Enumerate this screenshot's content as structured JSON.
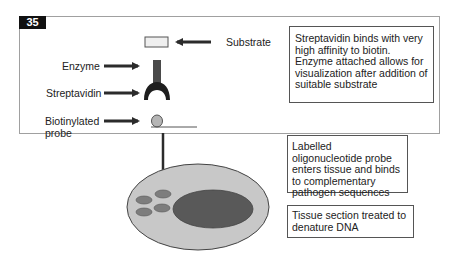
{
  "figure": {
    "number": "35",
    "labels": {
      "substrate": "Substrate",
      "enzyme": "Enzyme",
      "streptavidin": "Streptavidin",
      "biotinylated_probe": "Biotinylated probe"
    },
    "boxes": [
      {
        "id": "streptavidin-box",
        "text": "Streptavidin binds with very high affinity to biotin. Enzyme attached allows for visualization after addition of suitable substrate"
      },
      {
        "id": "probe-box",
        "text": "Labelled oligonucleotide probe enters tissue and binds to complementary pathogen sequences"
      },
      {
        "id": "denature-box",
        "text": "Tissue section treated to denature DNA"
      }
    ],
    "colors": {
      "border": "#9a9a9a",
      "arrow": "#2b2b2b",
      "enzyme": "#4a4a4a",
      "streptavidin": "#1e1e1e",
      "biotin": "#b5b5b5",
      "cell": "#c8c8c8",
      "nucleus": "#595959",
      "target": "#7d7d7d",
      "substrate": "#efefef"
    }
  }
}
